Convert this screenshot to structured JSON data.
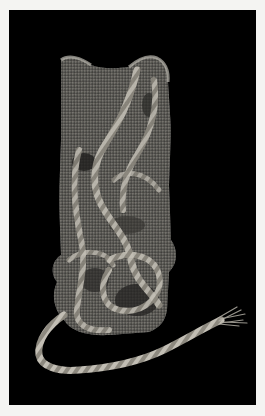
{
  "image": {
    "subject": "Ancient woven textile fragment with twisted cord",
    "description": "Grey, heavily textured rectangular woven fabric with looped twisted cords across its surface, with a long twisted cord trailing from the bottom and ending in a frayed tassel at lower right, photographed against a black background with a light border.",
    "colors": {
      "border": "#f4f4f2",
      "background": "#000000",
      "fabric": "#6e6c68",
      "fabric_highlight": "#b9b6ae",
      "fabric_shadow": "#2e2d2b",
      "cord": "#a8a49b"
    }
  }
}
